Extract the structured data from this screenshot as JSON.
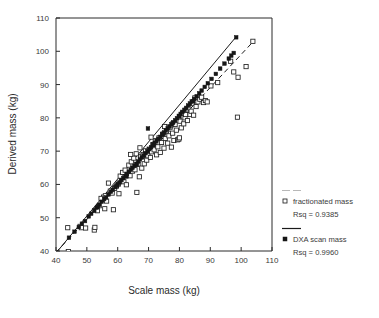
{
  "figure": {
    "background": "#ffffff",
    "ink_color": "#1a1a1a"
  },
  "chart_data": {
    "type": "scatter",
    "title": "",
    "xlabel": "Scale mass (kg)",
    "ylabel": "Derived mass (kg)",
    "xlim": [
      40,
      110
    ],
    "ylim": [
      40,
      110
    ],
    "xticks": [
      40,
      50,
      60,
      70,
      80,
      90,
      100,
      110
    ],
    "yticks": [
      40,
      50,
      60,
      70,
      80,
      90,
      100,
      110
    ],
    "grid": false,
    "legend_position": "right-outside",
    "series": [
      {
        "name": "fractionated mass",
        "marker": "open-square",
        "line_style": "dashed",
        "rsq_label": "Rsq = 0.9385",
        "rsq": 0.9385,
        "fit_line": {
          "x": [
            40,
            104
          ],
          "y": [
            39.6,
            103.0
          ]
        },
        "points": [
          [
            43.8,
            47.0
          ],
          [
            44.0,
            39.8
          ],
          [
            47.8,
            47.4
          ],
          [
            48.2,
            47.0
          ],
          [
            49.6,
            46.9
          ],
          [
            52.4,
            46.3
          ],
          [
            52.6,
            47.1
          ],
          [
            53.0,
            52.3
          ],
          [
            53.4,
            52.1
          ],
          [
            54.0,
            53.6
          ],
          [
            55.4,
            56.2
          ],
          [
            55.8,
            52.7
          ],
          [
            56.0,
            56.6
          ],
          [
            56.4,
            55.0
          ],
          [
            57.0,
            60.4
          ],
          [
            57.6,
            58.0
          ],
          [
            58.2,
            57.4
          ],
          [
            59.0,
            58.8
          ],
          [
            59.6,
            59.5
          ],
          [
            60.2,
            60.1
          ],
          [
            60.4,
            57.2
          ],
          [
            60.8,
            62.5
          ],
          [
            61.2,
            61.0
          ],
          [
            61.6,
            63.6
          ],
          [
            62.0,
            60.8
          ],
          [
            62.4,
            64.3
          ],
          [
            62.8,
            59.9
          ],
          [
            63.2,
            63.0
          ],
          [
            63.6,
            65.8
          ],
          [
            64.0,
            62.6
          ],
          [
            64.4,
            66.8
          ],
          [
            64.8,
            64.0
          ],
          [
            65.2,
            67.9
          ],
          [
            65.6,
            64.4
          ],
          [
            66.0,
            69.2
          ],
          [
            66.2,
            57.6
          ],
          [
            66.6,
            66.0
          ],
          [
            67.0,
            62.3
          ],
          [
            67.4,
            68.4
          ],
          [
            67.8,
            64.9
          ],
          [
            68.2,
            69.0
          ],
          [
            68.6,
            66.2
          ],
          [
            69.0,
            70.1
          ],
          [
            69.4,
            67.3
          ],
          [
            69.8,
            68.6
          ],
          [
            70.2,
            70.6
          ],
          [
            70.6,
            68.1
          ],
          [
            71.0,
            69.8
          ],
          [
            71.4,
            72.0
          ],
          [
            71.8,
            70.4
          ],
          [
            72.2,
            73.2
          ],
          [
            72.6,
            68.9
          ],
          [
            73.0,
            71.3
          ],
          [
            73.4,
            74.0
          ],
          [
            73.8,
            69.6
          ],
          [
            74.2,
            72.6
          ],
          [
            74.6,
            75.1
          ],
          [
            75.0,
            70.9
          ],
          [
            75.4,
            73.8
          ],
          [
            75.8,
            76.0
          ],
          [
            76.2,
            72.4
          ],
          [
            76.6,
            74.6
          ],
          [
            77.0,
            77.2
          ],
          [
            77.4,
            71.2
          ],
          [
            77.8,
            75.4
          ],
          [
            78.2,
            73.2
          ],
          [
            78.6,
            78.0
          ],
          [
            79.0,
            76.3
          ],
          [
            79.4,
            73.4
          ],
          [
            79.8,
            73.6
          ],
          [
            80.2,
            79.0
          ],
          [
            80.6,
            77.0
          ],
          [
            81.0,
            81.4
          ],
          [
            81.4,
            78.2
          ],
          [
            81.8,
            80.0
          ],
          [
            82.2,
            82.4
          ],
          [
            82.6,
            79.2
          ],
          [
            83.0,
            83.0
          ],
          [
            83.4,
            81.0
          ],
          [
            83.8,
            82.0
          ],
          [
            84.2,
            84.4
          ],
          [
            84.6,
            80.8
          ],
          [
            85.0,
            86.0
          ],
          [
            85.4,
            83.4
          ],
          [
            86.0,
            84.8
          ],
          [
            86.6,
            85.6
          ],
          [
            87.2,
            86.2
          ],
          [
            87.8,
            84.6
          ],
          [
            88.4,
            85.2
          ],
          [
            89.0,
            84.8
          ],
          [
            90.2,
            89.6
          ],
          [
            92.4,
            90.6
          ],
          [
            96.6,
            97.0
          ],
          [
            97.6,
            93.8
          ],
          [
            98.8,
            80.2
          ],
          [
            99.0,
            92.2
          ],
          [
            101.6,
            95.4
          ],
          [
            103.8,
            103.0
          ],
          [
            58.6,
            52.4
          ],
          [
            54.6,
            55.8
          ],
          [
            70.8,
            74.2
          ],
          [
            75.2,
            77.4
          ],
          [
            64.2,
            69.0
          ],
          [
            67.2,
            71.0
          ],
          [
            80.0,
            74.0
          ],
          [
            82.0,
            81.0
          ]
        ]
      },
      {
        "name": "DXA scan mass",
        "marker": "filled-square",
        "line_style": "solid",
        "rsq_label": "Rsq = 0.9960",
        "rsq": 0.996,
        "fit_line": {
          "x": [
            40,
            98.6
          ],
          "y": [
            39.4,
            104.6
          ]
        },
        "points": [
          [
            44.2,
            44.0
          ],
          [
            46.0,
            45.8
          ],
          [
            47.4,
            47.2
          ],
          [
            48.4,
            48.2
          ],
          [
            49.4,
            49.0
          ],
          [
            50.6,
            50.4
          ],
          [
            51.4,
            51.2
          ],
          [
            52.4,
            52.2
          ],
          [
            53.2,
            53.0
          ],
          [
            54.0,
            53.9
          ],
          [
            54.8,
            54.8
          ],
          [
            55.6,
            55.6
          ],
          [
            56.2,
            56.1
          ],
          [
            57.0,
            57.0
          ],
          [
            57.8,
            57.8
          ],
          [
            58.4,
            58.4
          ],
          [
            59.2,
            59.2
          ],
          [
            60.0,
            60.1
          ],
          [
            60.6,
            60.6
          ],
          [
            61.2,
            61.3
          ],
          [
            61.8,
            61.9
          ],
          [
            62.4,
            62.5
          ],
          [
            63.0,
            63.1
          ],
          [
            63.6,
            63.8
          ],
          [
            64.2,
            64.4
          ],
          [
            64.8,
            65.0
          ],
          [
            65.4,
            65.6
          ],
          [
            66.0,
            66.2
          ],
          [
            66.6,
            66.9
          ],
          [
            67.2,
            67.5
          ],
          [
            67.8,
            68.1
          ],
          [
            68.4,
            68.7
          ],
          [
            69.0,
            69.4
          ],
          [
            69.6,
            70.0
          ],
          [
            70.2,
            70.6
          ],
          [
            70.8,
            71.2
          ],
          [
            71.4,
            71.8
          ],
          [
            72.0,
            72.5
          ],
          [
            72.6,
            73.1
          ],
          [
            73.2,
            73.7
          ],
          [
            73.8,
            74.3
          ],
          [
            74.4,
            75.0
          ],
          [
            75.0,
            75.6
          ],
          [
            75.6,
            76.2
          ],
          [
            76.2,
            76.8
          ],
          [
            76.8,
            77.4
          ],
          [
            77.4,
            78.1
          ],
          [
            78.0,
            78.7
          ],
          [
            78.6,
            79.3
          ],
          [
            79.2,
            79.9
          ],
          [
            79.8,
            80.6
          ],
          [
            80.4,
            81.2
          ],
          [
            81.0,
            81.8
          ],
          [
            81.6,
            82.4
          ],
          [
            82.2,
            83.0
          ],
          [
            82.8,
            83.7
          ],
          [
            83.4,
            84.3
          ],
          [
            84.0,
            84.9
          ],
          [
            84.8,
            85.7
          ],
          [
            85.6,
            86.5
          ],
          [
            86.4,
            87.4
          ],
          [
            87.2,
            88.2
          ],
          [
            88.2,
            89.3
          ],
          [
            89.2,
            90.4
          ],
          [
            90.4,
            91.7
          ],
          [
            91.8,
            93.2
          ],
          [
            93.2,
            94.8
          ],
          [
            94.6,
            96.3
          ],
          [
            96.0,
            97.8
          ],
          [
            96.8,
            98.7
          ],
          [
            97.6,
            99.5
          ],
          [
            98.4,
            104.2
          ],
          [
            69.8,
            76.8
          ],
          [
            62.8,
            62.4
          ],
          [
            71.6,
            72.0
          ],
          [
            66.2,
            66.0
          ],
          [
            74.8,
            75.2
          ],
          [
            59.8,
            59.6
          ],
          [
            53.6,
            53.4
          ],
          [
            80.0,
            80.4
          ],
          [
            84.4,
            85.0
          ],
          [
            77.8,
            78.4
          ]
        ]
      }
    ]
  },
  "axes": {
    "x_title": "Scale mass (kg)",
    "y_title": "Derived mass (kg)",
    "x_tick_labels": [
      "40",
      "50",
      "60",
      "70",
      "80",
      "90",
      "100",
      "110"
    ],
    "y_tick_labels": [
      "40",
      "50",
      "60",
      "70",
      "80",
      "90",
      "100",
      "110"
    ]
  },
  "legend": {
    "entries": [
      {
        "line_style": "dashed",
        "marker": "open-square",
        "label": "fractionated mass",
        "rsq": "Rsq = 0.9385"
      },
      {
        "line_style": "solid",
        "marker": "filled-square",
        "label": "DXA scan mass",
        "rsq": "Rsq = 0.9960"
      }
    ]
  }
}
